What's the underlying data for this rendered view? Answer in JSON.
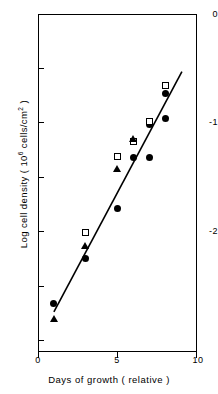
{
  "chart_data": {
    "type": "scatter",
    "title": "",
    "xlabel": "Days of growth ( relative )",
    "ylabel": "Log cell density ( 10⁶ cells/cm² )",
    "xlim": [
      0,
      10
    ],
    "ylim": [
      -3.11,
      0
    ],
    "grid": false,
    "legend": "none",
    "xticks": [
      {
        "value": 0,
        "label": "0"
      },
      {
        "value": 5,
        "label": "5"
      },
      {
        "value": 10,
        "label": "10"
      }
    ],
    "yticks": [
      {
        "value": 0,
        "label": "0",
        "minor": false
      },
      {
        "value": -0.5,
        "label": "",
        "minor": true
      },
      {
        "value": -1,
        "label": "-1",
        "minor": false
      },
      {
        "value": -1.5,
        "label": "",
        "minor": true
      },
      {
        "value": -2,
        "label": "-2",
        "minor": false
      },
      {
        "value": -2.5,
        "label": "",
        "minor": true
      },
      {
        "value": -3,
        "label": "",
        "minor": true
      }
    ],
    "series": [
      {
        "name": "filled-circle",
        "marker": "filled-circle",
        "points": [
          {
            "x": 1,
            "y": -2.66
          },
          {
            "x": 3,
            "y": -2.25
          },
          {
            "x": 5,
            "y": -1.79
          },
          {
            "x": 6,
            "y": -1.32
          },
          {
            "x": 7,
            "y": -1.02
          },
          {
            "x": 7,
            "y": -1.32
          },
          {
            "x": 8,
            "y": -0.73
          },
          {
            "x": 8,
            "y": -0.96
          }
        ]
      },
      {
        "name": "open-square",
        "marker": "open-square",
        "points": [
          {
            "x": 3,
            "y": -2.01
          },
          {
            "x": 5,
            "y": -1.31
          },
          {
            "x": 6,
            "y": -1.17
          },
          {
            "x": 7,
            "y": -0.99
          },
          {
            "x": 8,
            "y": -0.66
          }
        ]
      },
      {
        "name": "filled-triangle",
        "marker": "filled-triangle",
        "points": [
          {
            "x": 1,
            "y": -2.81
          },
          {
            "x": 3,
            "y": -2.14
          },
          {
            "x": 5,
            "y": -1.43
          },
          {
            "x": 6,
            "y": -1.15
          }
        ]
      }
    ],
    "fit_line": {
      "name": "regression-line",
      "x_start": 1.0,
      "y_start": -2.74,
      "x_end": 9.05,
      "y_end": -0.53
    }
  }
}
